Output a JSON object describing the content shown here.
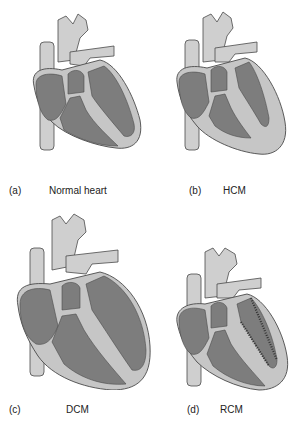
{
  "colors": {
    "chamber": "#7d7d7d",
    "tissue": "#c6c6c6",
    "outline": "#4a4a4a",
    "vessel": "#cfcfcf"
  },
  "panels": [
    {
      "letter": "(a)",
      "label": "Normal heart"
    },
    {
      "letter": "(b)",
      "label": "HCM"
    },
    {
      "letter": "(c)",
      "label": "DCM"
    },
    {
      "letter": "(d)",
      "label": "RCM"
    }
  ]
}
